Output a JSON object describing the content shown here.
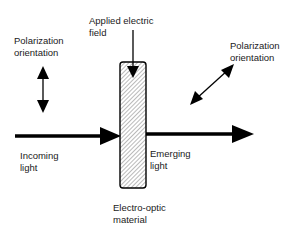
{
  "diagram": {
    "labels": {
      "polarization_in_line1": "Polarization",
      "polarization_in_line2": "orientation",
      "applied_field_line1": "Applied electric",
      "applied_field_line2": "field",
      "polarization_out_line1": "Polarization",
      "polarization_out_line2": "orientation",
      "incoming_line1": "Incoming",
      "incoming_line2": "light",
      "emerging_line1": "Emerging",
      "emerging_line2": "light",
      "material_line1": "Electro-optic",
      "material_line2": "material"
    },
    "colors": {
      "stroke": "#000000",
      "hatch": "#555555",
      "background": "#ffffff"
    }
  }
}
